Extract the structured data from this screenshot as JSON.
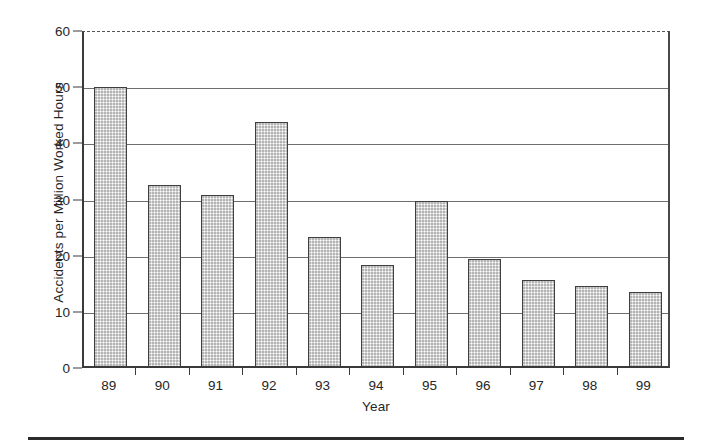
{
  "chart_data": {
    "type": "bar",
    "title": "",
    "xlabel": "Year",
    "ylabel": "Accidents per Million Worked Hours",
    "categories": [
      "89",
      "90",
      "91",
      "92",
      "93",
      "94",
      "95",
      "96",
      "97",
      "98",
      "99"
    ],
    "values": [
      49.7,
      32.3,
      30.5,
      43.4,
      23.0,
      18.0,
      29.3,
      19.1,
      15.3,
      14.2,
      13.2
    ],
    "ylim": [
      0,
      60
    ],
    "yticks": [
      "0",
      "10",
      "20",
      "30",
      "40",
      "50",
      "60"
    ],
    "ytick_values": [
      0,
      10,
      20,
      30,
      40,
      50,
      60
    ],
    "grid": "horizontal",
    "legend": "none",
    "bar_fill_color": "#dcdcdc",
    "bar_border_color": "#3f3f3f",
    "axis_color": "#3a3a3a",
    "gridline_color": "#6e6e6e",
    "background_color": "#ffffff"
  }
}
